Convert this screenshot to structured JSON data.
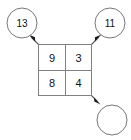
{
  "diagram": {
    "type": "grid-with-sum-nodes",
    "background_color": "#ffffff",
    "line_color": "#808080",
    "text_color": "#111111",
    "grid": {
      "rows": 2,
      "cols": 2,
      "cells": [
        {
          "row": 0,
          "col": 0,
          "value": "9"
        },
        {
          "row": 0,
          "col": 1,
          "value": "3"
        },
        {
          "row": 1,
          "col": 0,
          "value": "8"
        },
        {
          "row": 1,
          "col": 1,
          "value": "4"
        }
      ]
    },
    "nodes": [
      {
        "id": "node-top-left",
        "value": "13",
        "empty": false
      },
      {
        "id": "node-top-right",
        "value": "11",
        "empty": false
      },
      {
        "id": "node-bottom-right",
        "value": "",
        "empty": true
      }
    ],
    "arrows": [
      {
        "id": "arrow-to-top-left",
        "from": "grid-corner-top-left",
        "to": "node-top-left",
        "direction": "up-left"
      },
      {
        "id": "arrow-to-top-right",
        "from": "grid-corner-top-right",
        "to": "node-top-right",
        "direction": "up-right"
      },
      {
        "id": "arrow-to-bottom-right",
        "from": "grid-corner-bottom-right",
        "to": "node-bottom-right",
        "direction": "down-right"
      }
    ]
  }
}
